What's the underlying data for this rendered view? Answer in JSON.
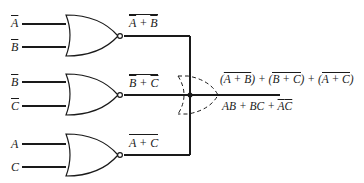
{
  "diagram": {
    "type": "logic-circuit",
    "gates": [
      {
        "id": "nor1",
        "type": "NOR",
        "inputs": [
          "A̅",
          "B̅"
        ],
        "output_label": "A̅ + B̅ (overbar)"
      },
      {
        "id": "nor2",
        "type": "NOR",
        "inputs": [
          "B̅",
          "C̅"
        ],
        "output_label": "B̅ + C̅ (overbar)"
      },
      {
        "id": "nor3",
        "type": "NOR",
        "inputs": [
          "A",
          "C"
        ],
        "output_label": "A + C (overbar)"
      }
    ],
    "inputs": {
      "g1a": "A",
      "g1b": "B",
      "g2a": "B",
      "g2b": "C",
      "g3a": "A",
      "g3b": "C"
    },
    "outputs": {
      "g1": "A + B",
      "g2": "B + C",
      "g3": "A + C"
    },
    "result": {
      "expr_parts": [
        "(",
        "A + B",
        ") + (",
        "B + C",
        ") + (",
        "A + C",
        ")"
      ],
      "simplified": [
        "AB + BC + ",
        "A",
        "C"
      ]
    },
    "wired_or": "dashed OR gate symbol at junction"
  }
}
